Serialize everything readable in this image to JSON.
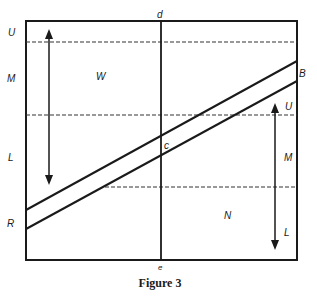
{
  "figure": {
    "caption": "Figure 3",
    "frame": {
      "x1": 26,
      "y1": 21,
      "x2": 297,
      "y2": 260
    },
    "vertical_axis": {
      "x": 161,
      "top_label": "d",
      "bottom_label": "e"
    },
    "dashed_lines": [
      {
        "name": "upper-dashed",
        "x1": 26,
        "x2": 297,
        "y": 42
      },
      {
        "name": "middle-dashed",
        "x1": 26,
        "x2": 297,
        "y": 115
      },
      {
        "name": "lower-dashed",
        "x1": 105,
        "x2": 297,
        "y": 187
      }
    ],
    "diagonals": [
      {
        "name": "upper-diagonal",
        "x1": 26,
        "y1": 210,
        "x2": 297,
        "y2": 61
      },
      {
        "name": "lower-diagonal",
        "x1": 26,
        "y1": 229,
        "x2": 297,
        "y2": 81
      }
    ],
    "arrows": [
      {
        "name": "left-double-arrow",
        "x": 49,
        "y1": 30,
        "y2": 184
      },
      {
        "name": "right-double-arrow",
        "x": 275,
        "y1": 104,
        "y2": 249
      }
    ],
    "labels": {
      "left_U": "U",
      "left_M": "M",
      "left_L": "L",
      "left_R": "R",
      "region_W": "W",
      "top_d": "d",
      "center_c": "c",
      "right_B": "B",
      "right_U": "U",
      "right_M": "M",
      "region_N": "N",
      "right_L": "L",
      "bottom_e": "e"
    }
  }
}
